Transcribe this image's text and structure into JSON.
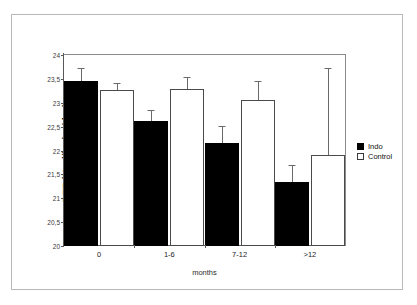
{
  "chart_data": {
    "type": "bar",
    "title": "",
    "xlabel": "months",
    "ylabel": "REE (Kcal/kg bw/day)",
    "categories": [
      "0",
      "1-6",
      "7-12",
      ">12"
    ],
    "ylim": [
      20,
      24
    ],
    "ytick_labels": [
      "20",
      "20,5",
      "21",
      "21,5",
      "22",
      "22,5",
      "23",
      "23,5",
      "24"
    ],
    "ytick_values": [
      20,
      20.5,
      21,
      21.5,
      22,
      22.5,
      23,
      23.5,
      24
    ],
    "grid": false,
    "legend_position": "right",
    "series": [
      {
        "name": "Indo",
        "color": "#000000",
        "values": [
          23.45,
          22.62,
          22.15,
          21.33
        ],
        "errors_upper": [
          23.72,
          22.85,
          22.51,
          21.7
        ]
      },
      {
        "name": "Control",
        "color": "#ffffff",
        "values": [
          23.27,
          23.28,
          23.06,
          21.9
        ],
        "errors_upper": [
          23.42,
          23.53,
          23.46,
          23.73
        ]
      }
    ]
  },
  "legend": {
    "items": [
      {
        "label": "Indo",
        "swatch": "filled-square-icon"
      },
      {
        "label": "Control",
        "swatch": "open-square-icon"
      }
    ]
  }
}
